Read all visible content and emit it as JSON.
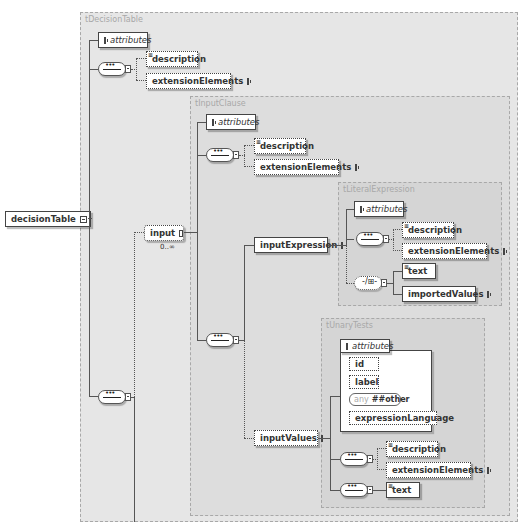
{
  "diagram": {
    "root": {
      "label": "decisionTable"
    },
    "types": {
      "decisionTable": "tDecisionTable",
      "inputClause": "tInputClause",
      "literalExpression": "tLiteralExpression",
      "unaryTests": "tUnaryTests"
    },
    "decisionTable": {
      "attributes": "attributes",
      "description": "description",
      "extensionElements": "extensionElements",
      "input": "input",
      "input_occurs": "0..∞"
    },
    "inputClause": {
      "attributes": "attributes",
      "description": "description",
      "extensionElements": "extensionElements",
      "inputExpression": "inputExpression",
      "inputValues": "inputValues"
    },
    "literalExpression": {
      "attributes": "attributes",
      "description": "description",
      "extensionElements": "extensionElements",
      "text": "text",
      "importedValues": "importedValues"
    },
    "unaryTests": {
      "attributes": "attributes",
      "attr_items": [
        "id",
        "label",
        "expressionLanguage"
      ],
      "any_keyword": "any",
      "any_value": "##other",
      "description": "description",
      "extensionElements": "extensionElements",
      "text": "text"
    },
    "choice_symbol": "-/⊞-"
  }
}
